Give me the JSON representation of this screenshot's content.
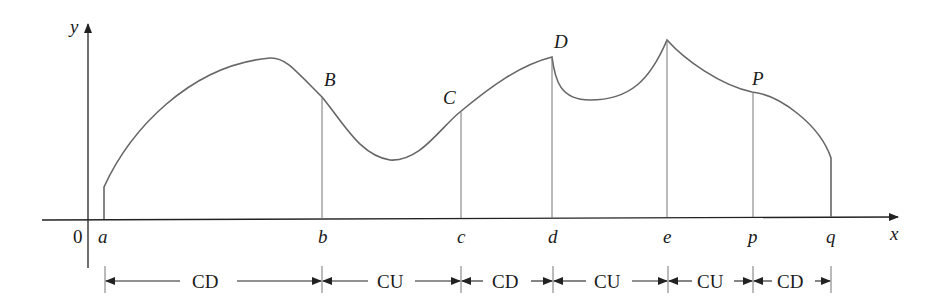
{
  "diagram": {
    "axes": {
      "x_label": "x",
      "y_label": "y",
      "origin_label": "0"
    },
    "x_ticks": [
      "a",
      "b",
      "c",
      "d",
      "e",
      "p",
      "q"
    ],
    "points": [
      "B",
      "C",
      "D",
      "P"
    ],
    "intervals": [
      {
        "from": "a",
        "to": "b",
        "label": "CD"
      },
      {
        "from": "b",
        "to": "c",
        "label": "CU"
      },
      {
        "from": "c",
        "to": "d",
        "label": "CD"
      },
      {
        "from": "d",
        "to": "e",
        "label": "CU"
      },
      {
        "from": "e",
        "to": "p",
        "label": "CU"
      },
      {
        "from": "p",
        "to": "q",
        "label": "CD"
      }
    ]
  }
}
